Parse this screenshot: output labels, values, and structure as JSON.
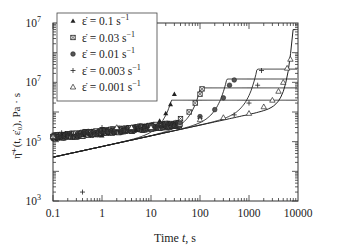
{
  "chart_data": {
    "type": "scatter",
    "title": "",
    "xlabel": "Time t, s",
    "ylabel": "η̄⁺(t, ε̇₀), Pa · s",
    "xscale": "log",
    "yscale": "log",
    "xlim": [
      0.1,
      10000
    ],
    "ylim": [
      1000,
      1000000000
    ],
    "x_ticks": [
      "0.1",
      "1",
      "10",
      "100",
      "1000",
      "10000"
    ],
    "y_ticks": [
      {
        "value": 1000,
        "base": "10",
        "exp": "3"
      },
      {
        "value": 100000,
        "base": "10",
        "exp": "5"
      },
      {
        "value": 10000000,
        "base": "10",
        "exp": "7"
      },
      {
        "value": 1000000000,
        "base": "10",
        "exp": "7"
      }
    ],
    "grid": false,
    "legend_position": "upper left",
    "series": [
      {
        "name": "ε̇ = 0.1 s⁻¹",
        "marker": "filled-triangle",
        "points": [
          [
            0.1,
            150000
          ],
          [
            1,
            160000
          ],
          [
            5,
            250000
          ],
          [
            10,
            350000
          ],
          [
            15,
            500000
          ],
          [
            20,
            900000
          ],
          [
            25,
            1800000
          ],
          [
            30,
            4000000
          ]
        ],
        "model_plateau": 2500000,
        "model_upturn_t": 25
      },
      {
        "name": "ε̇ = 0.03 s⁻¹",
        "marker": "crossed-square",
        "points": [
          [
            0.1,
            150000
          ],
          [
            10,
            330000
          ],
          [
            40,
            600000
          ],
          [
            60,
            1000000
          ],
          [
            80,
            2000000
          ],
          [
            100,
            4000000
          ],
          [
            110,
            6000000
          ]
        ],
        "model_plateau": 6500000,
        "model_upturn_t": 90
      },
      {
        "name": "ε̇ = 0.01 s⁻¹",
        "marker": "filled-circle",
        "points": [
          [
            0.1,
            150000
          ],
          [
            10,
            320000
          ],
          [
            100,
            700000
          ],
          [
            200,
            1200000
          ],
          [
            300,
            3000000
          ],
          [
            400,
            8000000
          ],
          [
            500,
            12000000
          ]
        ],
        "model_plateau": 13000000,
        "model_upturn_t": 300
      },
      {
        "name": "ε̇ = 0.003 s⁻¹",
        "marker": "plus",
        "points": [
          [
            0.4,
            2000
          ],
          [
            0.15,
            200000
          ],
          [
            1,
            300000
          ],
          [
            10,
            300000
          ],
          [
            100,
            600000
          ],
          [
            500,
            800000
          ],
          [
            1000,
            2000000
          ],
          [
            1500,
            8000000
          ],
          [
            1800,
            25000000
          ]
        ],
        "model_plateau": 28000000,
        "model_upturn_t": 1200
      },
      {
        "name": "ε̇ = 0.001 s⁻¹",
        "marker": "open-triangle",
        "points": [
          [
            0.1,
            150000
          ],
          [
            2,
            300000
          ],
          [
            4,
            300000
          ],
          [
            10,
            300000
          ],
          [
            100,
            550000
          ],
          [
            300,
            650000
          ],
          [
            1000,
            900000
          ],
          [
            2000,
            1500000
          ],
          [
            3000,
            2500000
          ],
          [
            4000,
            5000000
          ],
          [
            5000,
            10000000
          ],
          [
            6000,
            30000000
          ],
          [
            7000,
            60000000
          ]
        ],
        "model_plateau": null,
        "model_upturn_t": 5000
      }
    ],
    "linear_viscoelastic_envelope": [
      [
        0.1,
        30000
      ],
      [
        1,
        70000
      ],
      [
        10,
        170000
      ],
      [
        100,
        330000
      ],
      [
        1000,
        550000
      ],
      [
        5000,
        1000000
      ],
      [
        8000,
        80000000
      ]
    ]
  },
  "legend": {
    "items": [
      {
        "label": "ε̇ = 0.1 s",
        "sup": "−1"
      },
      {
        "label": "ε̇ = 0.03 s",
        "sup": "−1"
      },
      {
        "label": "ε̇ = 0.01 s",
        "sup": "−1"
      },
      {
        "label": "ε̇ = 0.003 s",
        "sup": "−1"
      },
      {
        "label": "ε̇ = 0.001 s",
        "sup": "−1"
      }
    ]
  },
  "axes": {
    "xlabel_prefix": "Time ",
    "xlabel_var": "t",
    "xlabel_unit": ", s",
    "ylabel": "η̄⁺(t, ε̇₀), Pa · s"
  }
}
